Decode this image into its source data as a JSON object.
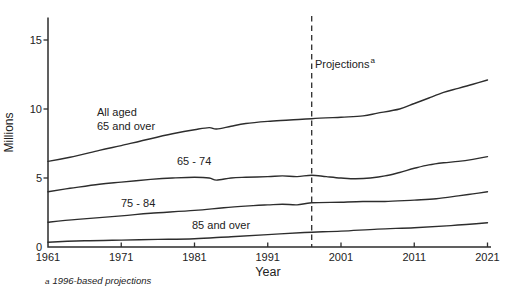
{
  "figure": {
    "colors": {
      "line": "#2d2d2d",
      "axis": "#2d2d2d",
      "text": "#222222",
      "background": "#ffffff"
    }
  },
  "annotations": {
    "projections": {
      "text": "Projections",
      "superscript": "a"
    },
    "footnote": {
      "marker": "a",
      "text": "1996-based projections"
    }
  },
  "chart_data": {
    "type": "line",
    "title": "",
    "xlabel": "Year",
    "ylabel": "Millions",
    "xlim": [
      1961,
      2021
    ],
    "ylim": [
      0,
      15
    ],
    "x_ticks": [
      1961,
      1971,
      1981,
      1991,
      2001,
      2011,
      2021
    ],
    "y_ticks": [
      0,
      5,
      10,
      15
    ],
    "grid": false,
    "legend": "inline-labels",
    "projection_divider_year": 1997,
    "series": [
      {
        "name": "All aged 65 and over",
        "label_lines": [
          "All aged",
          "65 and over"
        ],
        "points": [
          [
            1961,
            6.2
          ],
          [
            1964,
            6.5
          ],
          [
            1968,
            7.0
          ],
          [
            1971,
            7.35
          ],
          [
            1975,
            7.85
          ],
          [
            1978,
            8.2
          ],
          [
            1981,
            8.5
          ],
          [
            1983,
            8.65
          ],
          [
            1984,
            8.55
          ],
          [
            1986,
            8.75
          ],
          [
            1988,
            8.95
          ],
          [
            1991,
            9.1
          ],
          [
            1994,
            9.2
          ],
          [
            1997,
            9.3
          ],
          [
            2001,
            9.4
          ],
          [
            2004,
            9.5
          ],
          [
            2006,
            9.7
          ],
          [
            2009,
            10.0
          ],
          [
            2011,
            10.4
          ],
          [
            2013,
            10.8
          ],
          [
            2015,
            11.2
          ],
          [
            2017,
            11.5
          ],
          [
            2019,
            11.8
          ],
          [
            2021,
            12.1
          ]
        ]
      },
      {
        "name": "65 - 74",
        "points": [
          [
            1961,
            4.0
          ],
          [
            1964,
            4.25
          ],
          [
            1968,
            4.55
          ],
          [
            1971,
            4.7
          ],
          [
            1975,
            4.9
          ],
          [
            1978,
            5.0
          ],
          [
            1981,
            5.05
          ],
          [
            1983,
            5.0
          ],
          [
            1984,
            4.85
          ],
          [
            1986,
            5.0
          ],
          [
            1988,
            5.05
          ],
          [
            1991,
            5.1
          ],
          [
            1993,
            5.15
          ],
          [
            1995,
            5.1
          ],
          [
            1997,
            5.2
          ],
          [
            1999,
            5.1
          ],
          [
            2001,
            5.0
          ],
          [
            2003,
            4.95
          ],
          [
            2005,
            5.0
          ],
          [
            2007,
            5.15
          ],
          [
            2009,
            5.4
          ],
          [
            2011,
            5.7
          ],
          [
            2013,
            5.95
          ],
          [
            2015,
            6.1
          ],
          [
            2017,
            6.2
          ],
          [
            2019,
            6.35
          ],
          [
            2021,
            6.55
          ]
        ]
      },
      {
        "name": "75 - 84",
        "points": [
          [
            1961,
            1.8
          ],
          [
            1965,
            2.0
          ],
          [
            1971,
            2.25
          ],
          [
            1975,
            2.45
          ],
          [
            1981,
            2.65
          ],
          [
            1985,
            2.85
          ],
          [
            1989,
            3.0
          ],
          [
            1991,
            3.05
          ],
          [
            1993,
            3.1
          ],
          [
            1995,
            3.05
          ],
          [
            1997,
            3.2
          ],
          [
            2001,
            3.25
          ],
          [
            2004,
            3.3
          ],
          [
            2007,
            3.3
          ],
          [
            2011,
            3.4
          ],
          [
            2014,
            3.5
          ],
          [
            2017,
            3.7
          ],
          [
            2019,
            3.85
          ],
          [
            2021,
            4.0
          ]
        ]
      },
      {
        "name": "85 and over",
        "points": [
          [
            1961,
            0.35
          ],
          [
            1966,
            0.45
          ],
          [
            1971,
            0.5
          ],
          [
            1976,
            0.55
          ],
          [
            1981,
            0.6
          ],
          [
            1986,
            0.75
          ],
          [
            1991,
            0.9
          ],
          [
            1996,
            1.05
          ],
          [
            2001,
            1.15
          ],
          [
            2006,
            1.3
          ],
          [
            2011,
            1.4
          ],
          [
            2016,
            1.55
          ],
          [
            2021,
            1.75
          ]
        ]
      }
    ]
  }
}
